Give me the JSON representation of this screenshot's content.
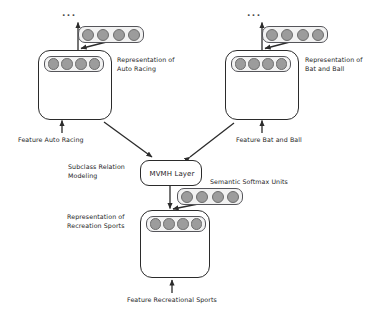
{
  "diagram": {
    "ellipsis": "...",
    "colors": {
      "stroke": "#2b2b2b",
      "unit_fill": "#9c9c9c",
      "unit_stroke": "#6d6d6d",
      "pill_fill": "#f2f2f2",
      "background": "#ffffff"
    },
    "nodes": {
      "auto_racing": {
        "representation_label": "Representation of\nAuto Racing",
        "feature_label": "Feature Auto Racing",
        "units": 4,
        "top_units": 4
      },
      "bat_and_ball": {
        "representation_label": "Representation of\nBat and Ball",
        "feature_label": "Feature Bat and Ball",
        "units": 4,
        "top_units": 4
      },
      "recreation_sports": {
        "representation_label": "Representation of\nRecreation Sports",
        "feature_label": "Feature Recreational Sports",
        "units": 4
      },
      "mvmh": {
        "label": "MVMH Layer",
        "side_label": "Subclass Relation\nModeling"
      },
      "softmax": {
        "label": "Semantic Softmax Units",
        "units": 4
      }
    }
  }
}
